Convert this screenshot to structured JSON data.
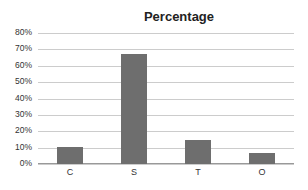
{
  "chart_data": {
    "type": "bar",
    "title": "Percentage",
    "categories": [
      "C",
      "S",
      "T",
      "O"
    ],
    "values": [
      10.5,
      67,
      14.5,
      6.5
    ],
    "xlabel": "",
    "ylabel": "",
    "ylim": [
      0,
      80
    ],
    "yticks": [
      "0%",
      "10%",
      "20%",
      "30%",
      "40%",
      "50%",
      "60%",
      "70%",
      "80%"
    ],
    "grid": true,
    "legend": null,
    "bar_color": "#6e6e6e"
  }
}
